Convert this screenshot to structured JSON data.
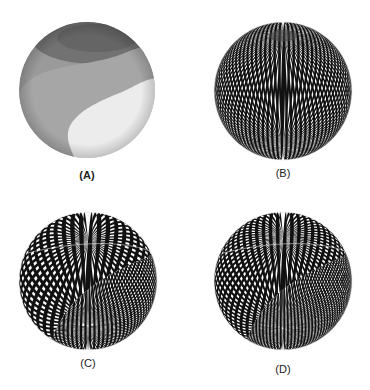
{
  "figure": {
    "panels": [
      {
        "id": "A",
        "label": "(A)",
        "label_bold": true,
        "type": "shaded",
        "cx": 87,
        "cy": 90,
        "r": 68,
        "label_x": 67,
        "label_y": 169,
        "colors": {
          "base": "#9a9a9a",
          "dark": "#6e6e6e",
          "mid": "#a6a6a6",
          "light": "#ececec"
        }
      },
      {
        "id": "B",
        "label": "(B)",
        "label_bold": false,
        "type": "striped",
        "cx": 283,
        "cy": 91,
        "r": 69,
        "tilt_deg": 55,
        "stripe_pairs": 90,
        "label_x": 263,
        "label_y": 167
      },
      {
        "id": "C",
        "label": "(C)",
        "label_bold": false,
        "type": "striped-seam",
        "cx": 88,
        "cy": 281,
        "r": 69,
        "tilt_deg": 35,
        "stripe_pairs": 48,
        "fine_pairs": 96,
        "label_x": 68,
        "label_y": 357
      },
      {
        "id": "D",
        "label": "(D)",
        "label_bold": false,
        "type": "striped-seam",
        "cx": 283,
        "cy": 281,
        "r": 69,
        "tilt_deg": 38,
        "stripe_pairs": 60,
        "fine_pairs": 120,
        "label_x": 263,
        "label_y": 363
      }
    ]
  }
}
